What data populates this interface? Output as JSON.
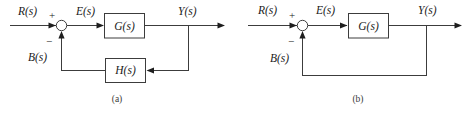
{
  "figure": {
    "width": 472,
    "height": 113,
    "background_color": "#ffffff",
    "line_color": "#3c3c3c",
    "text_color": "#1a1a1a",
    "caption_color": "#3a3a3a"
  },
  "diagram_a": {
    "caption": "(a)",
    "description": "Closed-loop feedback system with feedback element H(s)",
    "input_label": "R(s)",
    "error_label": "E(s)",
    "output_label": "Y(s)",
    "feedback_label": "B(s)",
    "plus_sign": "+",
    "minus_sign": "−",
    "forward_block_label": "G(s)",
    "feedback_block_label": "H(s)"
  },
  "diagram_b": {
    "caption": "(b)",
    "description": "Unity feedback system, feedback path returns output directly",
    "input_label": "R(s)",
    "error_label": "E(s)",
    "output_label": "Y(s)",
    "feedback_label": "B(s)",
    "plus_sign": "+",
    "minus_sign": "−",
    "forward_block_label": "G(s)"
  }
}
